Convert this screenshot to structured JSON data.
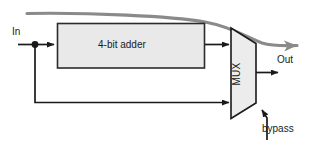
{
  "diagram": {
    "blocks": {
      "adder": {
        "label": "4-bit adder",
        "fill": "#e9e9e9",
        "stroke": "#2b2b2b"
      },
      "mux": {
        "label": "MUX",
        "fill": "#ececec",
        "stroke": "#1a1a1a"
      }
    },
    "ports": {
      "input": "In",
      "output": "Out",
      "select": "bypass"
    },
    "signals": {
      "wire_color": "#1a1a1a",
      "highlight_color": "#808080",
      "highlight_name": "critical-path-arrow"
    }
  }
}
